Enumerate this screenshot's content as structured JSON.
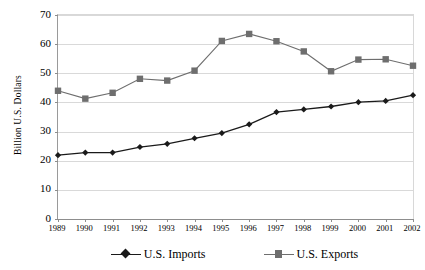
{
  "chart_data": {
    "type": "line",
    "title": "",
    "subtitle": "",
    "xlabel": "",
    "ylabel": "Billion U.S. Dollars",
    "categories": [
      "1989",
      "1990",
      "1991",
      "1992",
      "1993",
      "1994",
      "1995",
      "1996",
      "1997",
      "1998",
      "1999",
      "2000",
      "2001",
      "2002"
    ],
    "x": [
      1989,
      1990,
      1991,
      1992,
      1993,
      1994,
      1995,
      1996,
      1997,
      1998,
      1999,
      2000,
      2001,
      2002
    ],
    "ylim": [
      0,
      70
    ],
    "ytick_values": [
      0,
      10,
      20,
      30,
      40,
      50,
      60,
      70
    ],
    "ytick_labels": [
      "0",
      "10",
      "20",
      "30",
      "40",
      "50",
      "60",
      "70"
    ],
    "grid": true,
    "legend_position": "bottom",
    "series": [
      {
        "name": "U.S. Imports",
        "color": "#1a1a1a",
        "marker": "diamond",
        "values": [
          21.9,
          22.8,
          22.8,
          24.7,
          25.8,
          27.7,
          29.5,
          32.5,
          36.7,
          37.6,
          38.6,
          40.1,
          40.5,
          42.5
        ]
      },
      {
        "name": "U.S. Exports",
        "color": "#6e6e6e",
        "marker": "square",
        "values": [
          44.0,
          41.3,
          43.3,
          48.1,
          47.5,
          50.9,
          61.1,
          63.5,
          61.0,
          57.5,
          50.7,
          54.7,
          54.8,
          52.6
        ]
      }
    ]
  },
  "legend": {
    "items": [
      {
        "label": "U.S. Imports"
      },
      {
        "label": "U.S. Exports"
      }
    ]
  },
  "colors": {
    "imports": "#1a1a1a",
    "exports": "#6e6e6e",
    "gridline": "#d9d9d9",
    "axis": "#8d8d8d",
    "background": "#ffffff"
  }
}
